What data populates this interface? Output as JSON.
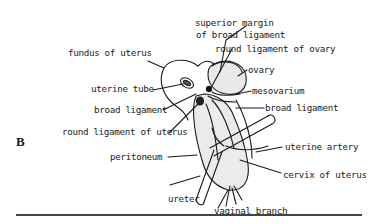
{
  "figure": {
    "panel_label": "B"
  },
  "labels": {
    "superior_margin_line1": "superior margin",
    "superior_margin_line2": "of broad ligament",
    "round_ligament_ovary": "round ligament of ovary",
    "fundus": "fundus of uterus",
    "ovary": "ovary",
    "uterine_tube": "uterine tube",
    "mesovarium": "mesovarium",
    "broad_ligament_left": "broad ligament",
    "broad_ligament_right": "broad ligament",
    "round_ligament_uterus": "round ligament of uterus",
    "uterine_artery": "uterine artery",
    "peritoneum": "peritoneum",
    "cervix": "cervix of uterus",
    "ureter": "ureter",
    "vaginal_branch": "vaginal branch"
  },
  "colors": {
    "ink": "#1a1a1a",
    "shade": "#e6e6e6",
    "rule": "#444444"
  }
}
